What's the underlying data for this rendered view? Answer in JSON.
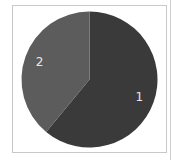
{
  "chart_data": {
    "type": "pie",
    "title": "",
    "categories": [
      "1",
      "2"
    ],
    "values": [
      61,
      39
    ],
    "colors": [
      "#3a3a3a",
      "#5c5c5c"
    ],
    "labels_on_slices": true,
    "start_angle_deg": 0,
    "direction": "clockwise",
    "legend": "none"
  },
  "labels": {
    "slice_1": "1",
    "slice_2": "2"
  }
}
